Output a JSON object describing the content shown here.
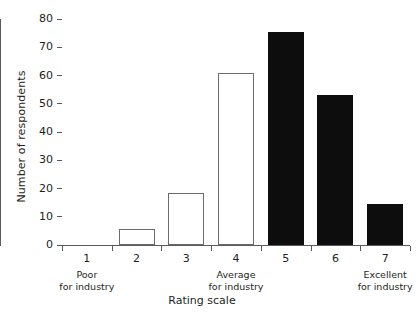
{
  "chart_data": {
    "type": "bar",
    "title": "",
    "xlabel": "Rating scale",
    "ylabel": "Number of respondents",
    "categories": [
      "1",
      "2",
      "3",
      "4",
      "5",
      "6",
      "7"
    ],
    "values": [
      0,
      5.5,
      18.5,
      61,
      75.5,
      53,
      14.5
    ],
    "bar_styles": [
      "outlined",
      "outlined",
      "outlined",
      "outlined",
      "filled",
      "filled",
      "filled"
    ],
    "ylim": [
      0,
      80
    ],
    "yticks": [
      0,
      10,
      20,
      30,
      40,
      50,
      60,
      70,
      80
    ],
    "ytick_labels": [
      "0",
      "10",
      "20",
      "30",
      "40",
      "50",
      "60",
      "70",
      "80"
    ],
    "xtick_sublabels": [
      "Poor\nfor industry",
      "",
      "",
      "Average\nfor industry",
      "",
      "",
      "Excellent\nfor industry"
    ],
    "grid": false,
    "legend": "none",
    "colors": {
      "outlined_fill": "#ffffff",
      "outlined_stroke": "#6b6b6b",
      "filled": "#0d0d0d",
      "axis": "#5a5a5a",
      "text": "#231f20",
      "background": "#ffffff"
    },
    "annotations": []
  },
  "axis": {
    "y_title": "Number of respondents",
    "x_title": "Rating scale"
  },
  "x_sublabels": {
    "poor": "Poor",
    "poor_line2": "for industry",
    "average": "Average",
    "average_line2": "for industry",
    "excellent": "Excellent",
    "excellent_line2": "for industry"
  }
}
